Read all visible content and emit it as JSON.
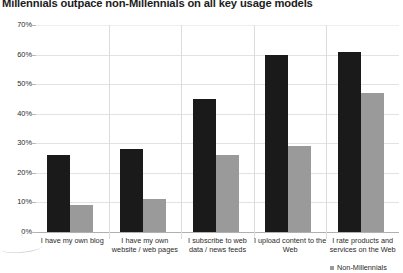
{
  "chart_data": {
    "type": "bar",
    "title": "Millennials outpace non-Millennials on all key usage models",
    "xlabel": "",
    "ylabel": "",
    "ylim": [
      0,
      70
    ],
    "ytick_labels": [
      "70%",
      "60%",
      "50%",
      "40%",
      "30%",
      "20%",
      "10%",
      "0%"
    ],
    "ytick_values": [
      70,
      60,
      50,
      40,
      30,
      20,
      10,
      0
    ],
    "grid": true,
    "legend_position": "bottom-right",
    "categories": [
      "I have my own blog",
      "I have my own website / web pages",
      "I subscribe to web data / news feeds",
      "I upload content to the Web",
      "I rate products and services on the Web"
    ],
    "series": [
      {
        "name": "Millennials",
        "color": "#1a1a1a",
        "values": [
          26,
          28,
          45,
          60,
          61
        ]
      },
      {
        "name": "Non-Millennials",
        "color": "#9a9a9a",
        "values": [
          9,
          11,
          26,
          29,
          47
        ]
      }
    ],
    "legend_entries": [
      {
        "label": "Non-Millennials",
        "color": "#9a9a9a"
      }
    ]
  }
}
